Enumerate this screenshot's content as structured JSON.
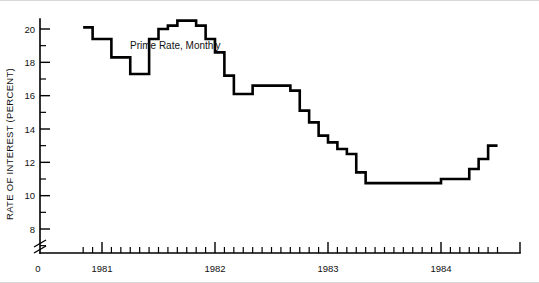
{
  "chart_data": {
    "type": "line",
    "title": "",
    "xlabel": "",
    "ylabel": "RATE OF INTEREST (PERCENT)",
    "annotation": "Prime Rate, Monthly",
    "series_name": "Prime Rate, Monthly",
    "step_style": "post",
    "grid": false,
    "legend": "none",
    "line_color": "#000000",
    "axis_break": true,
    "xlim": [
      1980.75,
      1984.5
    ],
    "ylim": [
      7.0,
      21.0
    ],
    "yticks_major": [
      8,
      10,
      12,
      14,
      16,
      18,
      20
    ],
    "yticks_major_labels": [
      "8",
      "10",
      "12",
      "14",
      "16",
      "18",
      "20"
    ],
    "yticks_minor": [
      7,
      9,
      11,
      13,
      15,
      17,
      19,
      21
    ],
    "origin_label": "0",
    "xticks_major": [
      1981,
      1982,
      1983,
      1984
    ],
    "xticks_major_labels": [
      "1981",
      "1982",
      "1983",
      "1984"
    ],
    "x_tick_interval": "monthly",
    "x": [
      1980.833,
      1980.917,
      1981.0,
      1981.083,
      1981.167,
      1981.25,
      1981.333,
      1981.417,
      1981.5,
      1981.583,
      1981.667,
      1981.75,
      1981.833,
      1981.917,
      1982.0,
      1982.083,
      1982.167,
      1982.25,
      1982.333,
      1982.417,
      1982.5,
      1982.583,
      1982.667,
      1982.75,
      1982.833,
      1982.917,
      1983.0,
      1983.083,
      1983.167,
      1983.25,
      1983.333,
      1983.417,
      1983.5,
      1983.583,
      1983.667,
      1983.75,
      1983.833,
      1983.917,
      1984.0,
      1984.083,
      1984.167,
      1984.25,
      1984.333,
      1984.417
    ],
    "values": [
      20.1,
      19.4,
      19.4,
      18.3,
      18.3,
      17.3,
      17.3,
      19.4,
      20.0,
      20.2,
      20.5,
      20.5,
      20.2,
      19.4,
      18.6,
      17.2,
      16.1,
      16.1,
      16.6,
      16.6,
      16.6,
      16.6,
      16.3,
      15.1,
      14.4,
      13.6,
      13.2,
      12.8,
      12.5,
      11.4,
      10.75,
      10.75,
      10.75,
      10.75,
      10.75,
      10.75,
      10.75,
      10.75,
      11.0,
      11.0,
      11.0,
      11.6,
      12.2,
      13.0
    ],
    "units": "percent"
  },
  "figure": {
    "background_color": "#ffffff",
    "border_color": "#d8d8d8"
  }
}
